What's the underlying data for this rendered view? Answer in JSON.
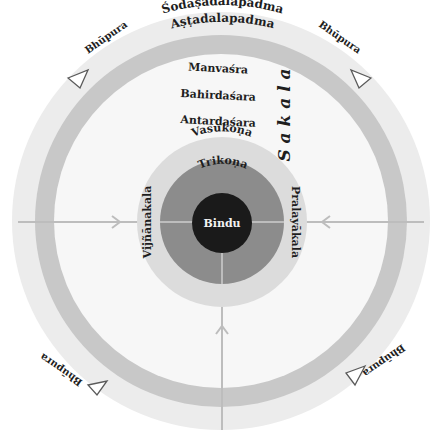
{
  "diagram": {
    "type": "concentric-mandala",
    "colors": {
      "outer_ring": "#ececec",
      "band": "#c8c8c8",
      "inner_field": "#f7f7f7",
      "vasukona": "#dcdcdc",
      "trikona": "#8c8c8c",
      "bindu": "#1a1a1a",
      "axis_line": "#bdbdbd",
      "arrow_stroke": "#5a5a5a"
    },
    "rings": {
      "outer": "Śodaṣadalapadma",
      "band": "Aṣṭadalapadma",
      "manvasra": "Manvaśra",
      "bahirdasara": "Bahirdaśara",
      "antardasara": "Antardaśara",
      "vasukona": "Vasukoṇa",
      "trikona": "Trikoṇa",
      "bindu": "Bindu"
    },
    "side_labels": {
      "left": "Vijñānakala",
      "right": "Pralayākala",
      "vertical": "S a k a l a"
    },
    "bhupura": {
      "top_left": "Bhūpura",
      "top_right": "Bhūpura",
      "bottom_left": "Bhūpura",
      "bottom_right": "Bhūpura"
    }
  }
}
